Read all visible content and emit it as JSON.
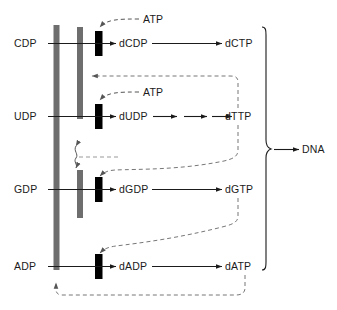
{
  "diagram": {
    "type": "biochemical-pathway",
    "background_color": "#ffffff",
    "ink_color": "#1b1b1b",
    "bar_colors": {
      "gray": "#6e6e6e",
      "black": "#000000"
    },
    "product_label": "DNA",
    "bracket": "curly-brace-right",
    "rows": [
      {
        "id": "cdp",
        "substrate": "CDP",
        "dNDP": "dCDP",
        "dNTP": "dCTP",
        "effector": "ATP",
        "intermediate_arrows": 1
      },
      {
        "id": "udp",
        "substrate": "UDP",
        "dNDP": "dUDP",
        "dNTP": "dTTP",
        "effector": "ATP",
        "intermediate_arrows": 3
      },
      {
        "id": "gdp",
        "substrate": "GDP",
        "dNDP": "dGDP",
        "dNTP": "dGTP",
        "effector": "",
        "intermediate_arrows": 1
      },
      {
        "id": "adp",
        "substrate": "ADP",
        "dNDP": "dADP",
        "dNTP": "dATP",
        "effector": "",
        "intermediate_arrows": 1
      }
    ],
    "feedback": [
      {
        "from": "dTTP",
        "to": "CDP/UDP reductase gate",
        "style": "dashed"
      },
      {
        "from": "dTTP",
        "to": "GDP reductase gate",
        "style": "dashed"
      },
      {
        "from": "dGTP",
        "to": "ADP reductase gate",
        "style": "dashed"
      },
      {
        "from": "dATP",
        "to": "overall reductase",
        "style": "dashed"
      }
    ],
    "labels": {
      "cdp": "CDP",
      "udp": "UDP",
      "gdp": "GDP",
      "adp": "ADP",
      "dcdp": "dCDP",
      "dudp": "dUDP",
      "dgdp": "dGDP",
      "dadp": "dADP",
      "dctp": "dCTP",
      "dttp": "dTTP",
      "dgtp": "dGTP",
      "datp": "dATP",
      "atp1": "ATP",
      "atp2": "ATP",
      "dna": "DNA"
    }
  }
}
